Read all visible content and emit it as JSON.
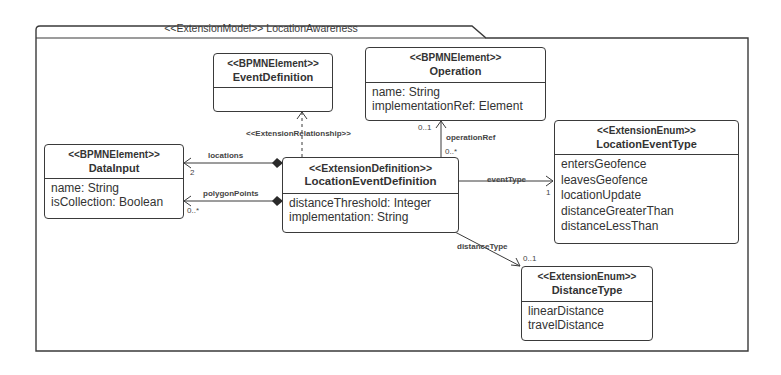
{
  "package": {
    "title": "<<ExtensionModel>> LocationAwareness"
  },
  "classes": {
    "event_definition": {
      "stereotype": "<<BPMNElement>>",
      "name": "EventDefinition",
      "attributes": []
    },
    "operation": {
      "stereotype": "<<BPMNElement>>",
      "name": "Operation",
      "attributes": [
        "name: String",
        "implementationRef: Element"
      ]
    },
    "data_input": {
      "stereotype": "<<BPMNElement>>",
      "name": "DataInput",
      "attributes": [
        "name: String",
        "isCollection: Boolean"
      ]
    },
    "location_event_definition": {
      "stereotype": "<<ExtensionDefinition>>",
      "name": "LocationEventDefinition",
      "attributes": [
        "distanceThreshold: Integer",
        "implementation: String"
      ]
    },
    "location_event_type": {
      "stereotype": "<<ExtensionEnum>>",
      "name": "LocationEventType",
      "attributes": [
        "entersGeofence",
        "leavesGeofence",
        "locationUpdate",
        "distanceGreaterThan",
        "distanceLessThan"
      ]
    },
    "distance_type": {
      "stereotype": "<<ExtensionEnum>>",
      "name": "DistanceType",
      "attributes": [
        "linearDistance",
        "travelDistance"
      ]
    }
  },
  "relations": {
    "extension_relationship": {
      "label": "<<ExtensionRelationship>>"
    },
    "locations": {
      "label": "locations",
      "multiplicity": "2"
    },
    "polygon_points": {
      "label": "polygonPoints",
      "multiplicity": "0..*"
    },
    "operation_ref": {
      "label": "operationRef",
      "source_multiplicity": "0..*",
      "target_multiplicity": "0..1"
    },
    "event_type": {
      "label": "eventType",
      "multiplicity": "1"
    },
    "distance_type": {
      "label": "distanceType",
      "multiplicity": "0..1"
    }
  },
  "colors": {
    "line": "#3a3a3a",
    "text": "#333333",
    "background": "#ffffff"
  }
}
